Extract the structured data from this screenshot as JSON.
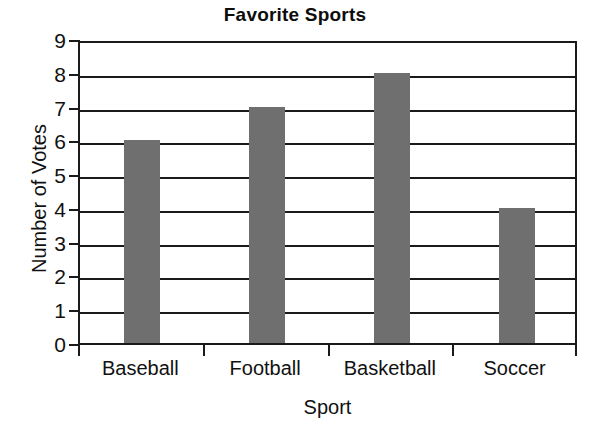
{
  "chart_data": {
    "type": "bar",
    "title": "Favorite Sports",
    "xlabel": "Sport",
    "ylabel": "Number of Votes",
    "categories": [
      "Baseball",
      "Football",
      "Basketball",
      "Soccer"
    ],
    "values": [
      6,
      7,
      8,
      4
    ],
    "ylim": [
      0,
      9
    ],
    "ytick_labels": [
      "9",
      "8",
      "7",
      "6",
      "5",
      "4",
      "3",
      "2",
      "1",
      "0"
    ],
    "ytick_values": [
      9,
      8,
      7,
      6,
      5,
      4,
      3,
      2,
      1,
      0
    ],
    "grid": "horizontal",
    "legend": "none",
    "bar_color": "#6f6f6f",
    "axis_color": "#1a1a1a",
    "background": "#ffffff"
  }
}
